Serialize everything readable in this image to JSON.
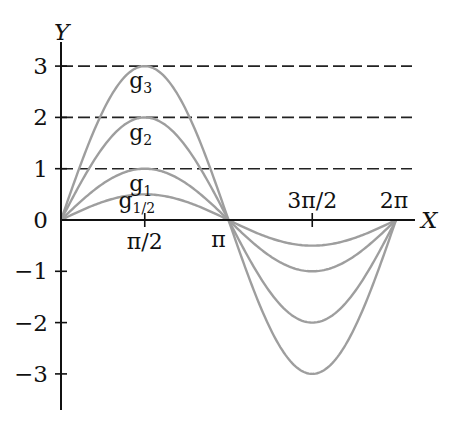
{
  "chart_data": {
    "type": "line",
    "title": "",
    "xlabel": "X",
    "ylabel": "Y",
    "xlim": [
      0,
      6.2832
    ],
    "ylim": [
      -3,
      3
    ],
    "x_ticks": [
      "π/2",
      "π",
      "3π/2",
      "2π"
    ],
    "y_ticks": [
      "3",
      "2",
      "1",
      "0",
      "−1",
      "−2",
      "−3"
    ],
    "reference_lines": [
      1,
      2,
      3
    ],
    "series": [
      {
        "name": "g3",
        "amplitude": 3,
        "label": "g",
        "sub": "3"
      },
      {
        "name": "g2",
        "amplitude": 2,
        "label": "g",
        "sub": "2"
      },
      {
        "name": "g1",
        "amplitude": 1,
        "label": "g",
        "sub": "1"
      },
      {
        "name": "g1/2",
        "amplitude": 0.5,
        "label": "g",
        "sub": "1/2"
      }
    ],
    "formula": "g_a(x) = a·sin(x), x ∈ [0, 2π]",
    "grid": false,
    "curve_color": "#9e9e9e",
    "axis_color": "#111111"
  }
}
